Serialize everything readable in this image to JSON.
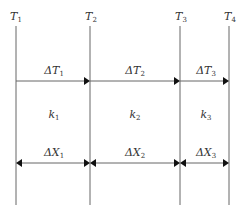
{
  "diagram": {
    "boundaries": [
      {
        "label": "T",
        "sub": "1",
        "x": 16
      },
      {
        "label": "T",
        "sub": "2",
        "x": 90
      },
      {
        "label": "T",
        "sub": "3",
        "x": 180
      },
      {
        "label": "T",
        "sub": "4",
        "x": 229
      }
    ],
    "temperature_diffs": [
      {
        "label": "ΔT",
        "sub": "1"
      },
      {
        "label": "ΔT",
        "sub": "2"
      },
      {
        "label": "ΔT",
        "sub": "3"
      }
    ],
    "conductivities": [
      {
        "label": "k",
        "sub": "1"
      },
      {
        "label": "k",
        "sub": "2"
      },
      {
        "label": "k",
        "sub": "3"
      }
    ],
    "thicknesses": [
      {
        "label": "ΔX",
        "sub": "1"
      },
      {
        "label": "ΔX",
        "sub": "2"
      },
      {
        "label": "ΔX",
        "sub": "3"
      }
    ],
    "colors": {
      "line": "#555555",
      "arrow": "#111111",
      "text": "#333333"
    }
  }
}
